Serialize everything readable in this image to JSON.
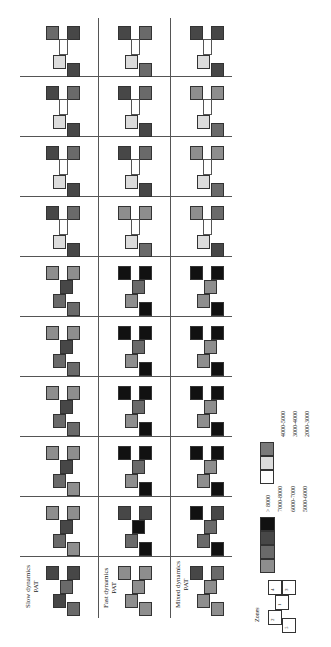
{
  "chart_data": {
    "type": "heatmap",
    "title": "",
    "orientation": "rotated 90 degrees counterclockwise",
    "scenarios": [
      "Slow dynamics",
      "Fast dynamics",
      "Mixed dynamics"
    ],
    "models": [
      "PAT",
      "AP",
      "LP",
      "DIR",
      "DCR",
      "ICR",
      "ILC",
      "IPS",
      "ITC",
      "ITW"
    ],
    "zones": [
      "1",
      "2",
      "3",
      "4",
      "5"
    ],
    "legend": {
      "title": "no. offices",
      "classes": [
        {
          "label": "> 8000",
          "color": "#111111"
        },
        {
          "label": "7000-8000",
          "color": "#474747"
        },
        {
          "label": "6000-7000",
          "color": "#6a6a6a"
        },
        {
          "label": "5000-6000",
          "color": "#8e8e8e"
        },
        {
          "label": "4000-5000",
          "color": "#7a7a7a"
        },
        {
          "label": "3000-4000",
          "color": "#dcdcdc"
        },
        {
          "label": "2000-3000",
          "color": "#ffffff"
        }
      ]
    },
    "zones_legend_title": "Zones",
    "values_note": "Each cell shows zone shade class per model/scenario; zone 1 center, 2 bottom-left, 3 top-right, 4 top-left, 5 bottom-right (image orientation)",
    "cells": {
      "ITW": {
        "Slow dynamics": {
          "4": "6000-7000",
          "3": "7000-8000",
          "1": "2000-3000",
          "2": "3000-4000",
          "5": "7000-8000"
        },
        "Fast dynamics": {
          "4": "7000-8000",
          "3": "6000-7000",
          "1": "2000-3000",
          "2": "3000-4000",
          "5": "6000-7000"
        },
        "Mixed dynamics": {
          "4": "7000-8000",
          "3": "7000-8000",
          "1": "2000-3000",
          "2": "3000-4000",
          "5": "7000-8000"
        }
      },
      "ITC": {
        "Slow dynamics": {
          "4": "7000-8000",
          "3": "6000-7000",
          "1": "2000-3000",
          "2": "3000-4000",
          "5": "7000-8000"
        },
        "Fast dynamics": {
          "4": "7000-8000",
          "3": "6000-7000",
          "1": "2000-3000",
          "2": "3000-4000",
          "5": "7000-8000"
        },
        "Mixed dynamics": {
          "4": "5000-6000",
          "3": "5000-6000",
          "1": "2000-3000",
          "2": "3000-4000",
          "5": "6000-7000"
        }
      },
      "IPS": {
        "Slow dynamics": {
          "4": "7000-8000",
          "3": "6000-7000",
          "1": "2000-3000",
          "2": "3000-4000",
          "5": "7000-8000"
        },
        "Fast dynamics": {
          "4": "7000-8000",
          "3": "6000-7000",
          "1": "2000-3000",
          "2": "3000-4000",
          "5": "7000-8000"
        },
        "Mixed dynamics": {
          "4": "5000-6000",
          "3": "5000-6000",
          "1": "2000-3000",
          "2": "3000-4000",
          "5": "6000-7000"
        }
      },
      "ILC": {
        "Slow dynamics": {
          "4": "7000-8000",
          "3": "6000-7000",
          "1": "2000-3000",
          "2": "3000-4000",
          "5": "7000-8000"
        },
        "Fast dynamics": {
          "4": "5000-6000",
          "3": "5000-6000",
          "1": "2000-3000",
          "2": "3000-4000",
          "5": "6000-7000"
        },
        "Mixed dynamics": {
          "4": "5000-6000",
          "3": "6000-7000",
          "1": "2000-3000",
          "2": "3000-4000",
          "5": "7000-8000"
        }
      },
      "ICR": {
        "Slow dynamics": {
          "4": "5000-6000",
          "3": "5000-6000",
          "1": "7000-8000",
          "2": "6000-7000",
          "5": "6000-7000"
        },
        "Fast dynamics": {
          "4": "> 8000",
          "3": "> 8000",
          "1": "6000-7000",
          "2": "5000-6000",
          "5": "> 8000"
        },
        "Mixed dynamics": {
          "4": "> 8000",
          "3": "> 8000",
          "1": "5000-6000",
          "2": "5000-6000",
          "5": "> 8000"
        }
      },
      "DCR": {
        "Slow dynamics": {
          "4": "5000-6000",
          "3": "5000-6000",
          "1": "7000-8000",
          "2": "6000-7000",
          "5": "6000-7000"
        },
        "Fast dynamics": {
          "4": "> 8000",
          "3": "> 8000",
          "1": "6000-7000",
          "2": "5000-6000",
          "5": "> 8000"
        },
        "Mixed dynamics": {
          "4": "> 8000",
          "3": "> 8000",
          "1": "5000-6000",
          "2": "5000-6000",
          "5": "> 8000"
        }
      },
      "DIR": {
        "Slow dynamics": {
          "4": "5000-6000",
          "3": "5000-6000",
          "1": "7000-8000",
          "2": "6000-7000",
          "5": "6000-7000"
        },
        "Fast dynamics": {
          "4": "> 8000",
          "3": "> 8000",
          "1": "6000-7000",
          "2": "5000-6000",
          "5": "> 8000"
        },
        "Mixed dynamics": {
          "4": "> 8000",
          "3": "> 8000",
          "1": "5000-6000",
          "2": "5000-6000",
          "5": "> 8000"
        }
      },
      "LP": {
        "Slow dynamics": {
          "4": "5000-6000",
          "3": "5000-6000",
          "1": "7000-8000",
          "2": "6000-7000",
          "5": "5000-6000"
        },
        "Fast dynamics": {
          "4": "> 8000",
          "3": "> 8000",
          "1": "6000-7000",
          "2": "5000-6000",
          "5": "> 8000"
        },
        "Mixed dynamics": {
          "4": "> 8000",
          "3": "> 8000",
          "1": "5000-6000",
          "2": "5000-6000",
          "5": "> 8000"
        }
      },
      "AP": {
        "Slow dynamics": {
          "4": "5000-6000",
          "3": "5000-6000",
          "1": "7000-8000",
          "2": "6000-7000",
          "5": "5000-6000"
        },
        "Fast dynamics": {
          "4": "7000-8000",
          "3": "7000-8000",
          "1": "> 8000",
          "2": "6000-7000",
          "5": "> 8000"
        },
        "Mixed dynamics": {
          "4": "> 8000",
          "3": "7000-8000",
          "1": "6000-7000",
          "2": "6000-7000",
          "5": "> 8000"
        }
      },
      "PAT": {
        "Slow dynamics": {
          "4": "7000-8000",
          "3": "7000-8000",
          "1": "6000-7000",
          "2": "7000-8000",
          "5": "6000-7000"
        },
        "Fast dynamics": {
          "4": "5000-6000",
          "3": "5000-6000",
          "1": "5000-6000",
          "2": "5000-6000",
          "5": "5000-6000"
        },
        "Mixed dynamics": {
          "4": "7000-8000",
          "3": "6000-7000",
          "1": "5000-6000",
          "2": "5000-6000",
          "5": "5000-6000"
        }
      }
    }
  },
  "labels": {
    "rows": [
      "ITW",
      "ITC",
      "IPS",
      "ILC",
      "ICR",
      "DCR",
      "DIR",
      "LP",
      "AP",
      "PAT"
    ],
    "scenario_line1": [
      "Slow dynamics",
      "Fast dynamics",
      "Mixed dynamics"
    ],
    "scenario_line2": "PAT",
    "legend_title": "no. offices",
    "legend_items": [
      "> 8000",
      "7000-8000",
      "6000-7000",
      "5000-6000",
      "4000-5000",
      "3000-4000",
      "2000-3000"
    ],
    "zones_title": "Zones",
    "zone_numbers": [
      "4",
      "3",
      "1",
      "2",
      "5"
    ]
  }
}
